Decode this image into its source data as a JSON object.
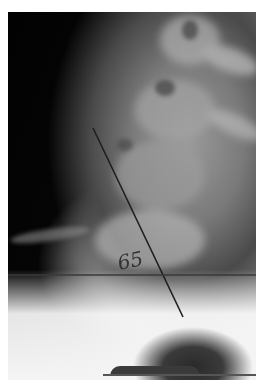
{
  "image": {
    "subject": "lateral lumbosacral spine radiograph",
    "annotation": {
      "angle_label": "65",
      "angle_unit": "degrees",
      "oblique_line": {
        "x1": 93,
        "y1": 128,
        "x2": 183,
        "y2": 317
      },
      "horizontal_line": {
        "x1": 8,
        "y1": 275,
        "x2": 256,
        "y2": 275
      },
      "line_color": "#1e1e1e"
    }
  }
}
